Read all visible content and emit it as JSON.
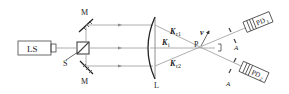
{
  "diagram": {
    "type": "optical-setup",
    "components": {
      "laser_source": {
        "label": "LS"
      },
      "beam_splitter": {
        "label": "S"
      },
      "mirror_top": {
        "label": "M"
      },
      "mirror_bottom": {
        "label": "M"
      },
      "lens": {
        "label": "L"
      },
      "point": {
        "label": "P"
      },
      "detector_1": {
        "label": "PD",
        "sub": "1"
      },
      "detector_2": {
        "label": "PD",
        "sub": "2"
      },
      "aperture_1": {
        "label": "A"
      },
      "aperture_2": {
        "label": "A"
      }
    },
    "vectors": {
      "kr1": {
        "label": "K",
        "sub": "r1"
      },
      "ki": {
        "label": "K",
        "sub": "i"
      },
      "kr2": {
        "label": "K",
        "sub": "r2"
      },
      "velocity": {
        "label": "v"
      }
    },
    "colors": {
      "line": "#444444",
      "beam": "#999999",
      "background": "#ffffff"
    }
  }
}
